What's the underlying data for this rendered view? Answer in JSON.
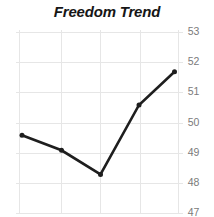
{
  "chart_data": {
    "type": "line",
    "title": "Freedom Trend",
    "x": [
      1,
      2,
      3,
      4,
      5
    ],
    "values": [
      49.6,
      49.1,
      48.3,
      50.6,
      51.7
    ],
    "xlabel": "",
    "ylabel": "",
    "ylim": [
      47,
      53
    ],
    "y_ticks": [
      53,
      52,
      51,
      50,
      49,
      48,
      47
    ],
    "y_axis_side": "right",
    "x_tick_labels": [],
    "grid": "on",
    "legend": "none",
    "marker": "circle",
    "series_count": 1
  },
  "colors": {
    "background": "#ffffff",
    "grid": "#e6e6e6",
    "tick_label": "#7b7b7b",
    "title": "#161616",
    "line": "#1e1e1e"
  }
}
